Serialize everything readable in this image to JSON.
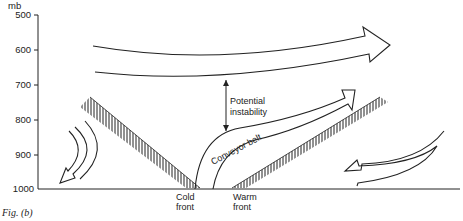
{
  "axis": {
    "unit": "mb",
    "ticks": [
      "500",
      "600",
      "700",
      "800",
      "900",
      "1000"
    ]
  },
  "labels": {
    "potential_line1": "Potential",
    "potential_line2": "instability",
    "conveyor": "Conveyor belt",
    "cold_line1": "Cold",
    "cold_line2": "front",
    "warm_line1": "Warm",
    "warm_line2": "front"
  },
  "caption": "Fig. (b)",
  "colors": {
    "line": "#222222",
    "background": "#ffffff"
  }
}
